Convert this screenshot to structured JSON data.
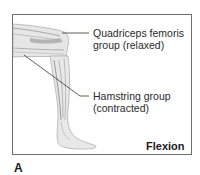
{
  "figure": {
    "panel_letter": "A",
    "state_label": "Flexion",
    "labels": {
      "quadriceps": {
        "line1": "Quadriceps femoris",
        "line2": "group (relaxed)"
      },
      "hamstring": {
        "line1": "Hamstring group",
        "line2": "(contracted)"
      }
    }
  },
  "colors": {
    "frame": "#6e6e6e",
    "muscle_shade": "#b8b8b8",
    "muscle_light": "#e4e4e4",
    "leader_line": "#333333",
    "text": "#2a2a2a"
  }
}
